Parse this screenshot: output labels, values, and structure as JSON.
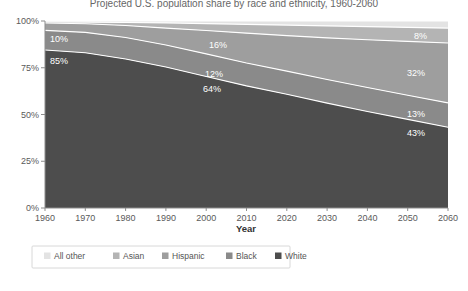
{
  "chart_data": {
    "type": "area",
    "title": "Projected U.S. population share by race and ethnicity, 1960-2060",
    "xlabel": "Year",
    "ylabel": "",
    "x": [
      1960,
      1970,
      1980,
      1990,
      2000,
      2010,
      2020,
      2030,
      2040,
      2050,
      2060
    ],
    "xlim": [
      1960,
      2060
    ],
    "ylim": [
      0,
      100
    ],
    "ytick_labels": [
      "0%",
      "25%",
      "50%",
      "75%",
      "100%"
    ],
    "ytick_values": [
      0,
      25,
      50,
      75,
      100
    ],
    "xtick_labels": [
      "1960",
      "1970",
      "1980",
      "1990",
      "2000",
      "2010",
      "2020",
      "2030",
      "2040",
      "2050",
      "2060"
    ],
    "grid": false,
    "stacked": true,
    "stack_order_bottom_to_top": [
      "White",
      "Black",
      "Hispanic",
      "Asian",
      "All other"
    ],
    "legend_position": "bottom",
    "series": [
      {
        "name": "All other",
        "color": "#e3e3e3",
        "values": [
          0.5,
          0.6,
          0.8,
          1.0,
          1.4,
          1.8,
          2.2,
          2.6,
          3.0,
          3.4,
          3.8
        ]
      },
      {
        "name": "Asian",
        "color": "#b4b4b4",
        "values": [
          0.6,
          0.9,
          1.6,
          2.8,
          3.7,
          4.7,
          5.6,
          6.4,
          7.0,
          7.5,
          8.0
        ]
      },
      {
        "name": "Hispanic",
        "color": "#9e9e9e",
        "values": [
          3.9,
          4.6,
          6.4,
          9.0,
          12.5,
          16.0,
          19.0,
          22.3,
          25.6,
          28.8,
          32.0
        ]
      },
      {
        "name": "Black",
        "color": "#8a8a8a",
        "values": [
          10.5,
          10.9,
          11.5,
          11.8,
          12.1,
          12.2,
          12.4,
          12.6,
          12.8,
          12.9,
          13.0
        ]
      },
      {
        "name": "White",
        "color": "#4d4d4d",
        "values": [
          84.5,
          83.0,
          79.7,
          75.4,
          70.3,
          65.3,
          60.8,
          56.1,
          51.6,
          47.4,
          43.2
        ]
      }
    ],
    "annotations": [
      {
        "text": "10%",
        "series": "Hispanic",
        "x": 1962,
        "note": "Hispanic band label at left"
      },
      {
        "text": "85%",
        "series": "White",
        "x": 1962,
        "note": "White band label at left"
      },
      {
        "text": "16%",
        "series": "Hispanic",
        "x": 2010,
        "note": "Hispanic band label mid"
      },
      {
        "text": "12%",
        "series": "Black",
        "x": 2007,
        "note": "Black band label mid"
      },
      {
        "text": "64%",
        "series": "White",
        "x": 2008,
        "note": "White band label mid"
      },
      {
        "text": "8%",
        "series": "Asian",
        "x": 2057,
        "note": "Asian band label right"
      },
      {
        "text": "32%",
        "series": "Hispanic",
        "x": 2056,
        "note": "Hispanic band label right"
      },
      {
        "text": "13%",
        "series": "Black",
        "x": 2056,
        "note": "Black band label right"
      },
      {
        "text": "43%",
        "series": "White",
        "x": 2056,
        "note": "White band label right"
      }
    ]
  },
  "legend": {
    "items": [
      {
        "label": "All other",
        "color": "#e3e3e3"
      },
      {
        "label": "Asian",
        "color": "#b4b4b4"
      },
      {
        "label": "Hispanic",
        "color": "#9e9e9e"
      },
      {
        "label": "Black",
        "color": "#8a8a8a"
      },
      {
        "label": "White",
        "color": "#4d4d4d"
      }
    ]
  },
  "axes": {
    "x_title": "Year",
    "y_ticks": [
      "100%",
      "75%",
      "50%",
      "25%",
      "0%"
    ],
    "x_ticks": [
      "1960",
      "1970",
      "1980",
      "1990",
      "2000",
      "2010",
      "2020",
      "2030",
      "2040",
      "2050",
      "2060"
    ]
  },
  "labels": {
    "hispanic_left": "10%",
    "white_left": "85%",
    "hispanic_mid": "16%",
    "black_mid": "12%",
    "white_mid": "64%",
    "asian_right": "8%",
    "hispanic_right": "32%",
    "black_right": "13%",
    "white_right": "43%"
  },
  "colors": {
    "all_other": "#e3e3e3",
    "asian": "#b4b4b4",
    "hispanic": "#9e9e9e",
    "black": "#8a8a8a",
    "white": "#4d4d4d",
    "axis": "#8d8d8d",
    "tick_text": "#5a5a5a",
    "label_text": "#ffffff"
  }
}
